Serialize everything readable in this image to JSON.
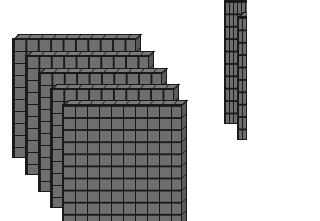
{
  "scene": {
    "description": "Base-ten block flats",
    "cell_color": "#6e6e6e",
    "line_color": "#1a1a1a",
    "background": "#ffffff",
    "grid_size": 10,
    "flats": [
      {
        "label": "flat-1",
        "x": 12,
        "y": 34,
        "w": 124,
        "h": 120
      },
      {
        "label": "flat-2",
        "x": 25,
        "y": 51,
        "w": 124,
        "h": 120
      },
      {
        "label": "flat-3",
        "x": 38,
        "y": 68,
        "w": 124,
        "h": 120
      },
      {
        "label": "flat-4",
        "x": 50,
        "y": 84,
        "w": 124,
        "h": 120
      },
      {
        "label": "flat-5",
        "x": 62,
        "y": 100,
        "w": 120,
        "h": 121
      }
    ],
    "partial_flats": [
      {
        "label": "right-flat-1",
        "x": 224,
        "y": -4,
        "w": 40,
        "h": 124
      },
      {
        "label": "right-flat-2",
        "x": 237,
        "y": 12,
        "w": 40,
        "h": 124
      }
    ]
  }
}
